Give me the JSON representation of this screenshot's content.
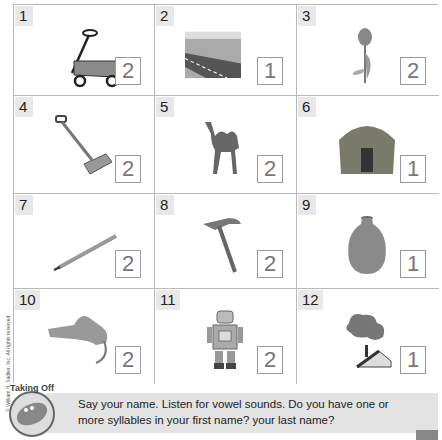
{
  "grid": {
    "items": [
      {
        "number": "1",
        "picture": "wagon",
        "answer": "2"
      },
      {
        "number": "2",
        "picture": "highway",
        "answer": "1"
      },
      {
        "number": "3",
        "picture": "tulip",
        "answer": "2"
      },
      {
        "number": "4",
        "picture": "shovel",
        "answer": "2"
      },
      {
        "number": "5",
        "picture": "camel",
        "answer": "2"
      },
      {
        "number": "6",
        "picture": "hut",
        "answer": "1"
      },
      {
        "number": "7",
        "picture": "pencil",
        "answer": "2"
      },
      {
        "number": "8",
        "picture": "hammer",
        "answer": "2"
      },
      {
        "number": "9",
        "picture": "vase",
        "answer": "1"
      },
      {
        "number": "10",
        "picture": "tiger",
        "answer": "2"
      },
      {
        "number": "11",
        "picture": "robot",
        "answer": "2"
      },
      {
        "number": "12",
        "picture": "chimney-smoke",
        "answer": "1"
      }
    ]
  },
  "copyright": "© William H. Sadlier, Inc. All rights reserved.",
  "footer": {
    "badge_label": "Taking Off",
    "text": "Say your name. Listen for vowel sounds. Do you have one or more syllables in your first name? your last name?"
  }
}
